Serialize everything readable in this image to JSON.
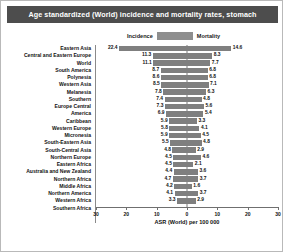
{
  "chart": {
    "title": "Age standardized (World) incidence and mortality rates, stomach",
    "xlabel": "ASR (World) per 100 000",
    "legend": {
      "left_label": "Incidence",
      "right_label": "Mortality",
      "swatch_color": "#8e8e8e"
    },
    "colors": {
      "bar": "#7f7f7f",
      "title_banner": "#4d4d4d",
      "title_text": "#ffffff",
      "axis": "#6f6f6f",
      "background": "#ffffff"
    },
    "xticks": [
      "30",
      "20",
      "10",
      "0",
      "10",
      "20",
      "30"
    ]
  },
  "chart_data": {
    "type": "bar",
    "title": "Age standardized (World) incidence and mortality rates, stomach",
    "xlabel": "ASR (World) per 100 000",
    "ylabel": "",
    "orientation": "horizontal-diverging",
    "xlim": [
      -30,
      30
    ],
    "grid": false,
    "legend_position": "top-center",
    "categories": [
      "Eastern Asia",
      "Central and Eastern Europe",
      "World",
      "South America",
      "Polynesia",
      "Western Asia",
      "Melanesia",
      "Southern",
      "Europe Central",
      "America",
      "Caribbean",
      "Western Europe",
      "Micronesia",
      "South-Eastern Asia",
      "South-Central Asia",
      "Northern Europe",
      "Eastern Africa",
      "Australia and New Zealand",
      "Northern Africa",
      "Middle Africa",
      "Northern America",
      "Western Africa",
      "Southern Africa"
    ],
    "series": [
      {
        "name": "Incidence",
        "values": [
          22.4,
          11.3,
          11.1,
          8.7,
          8.6,
          8.5,
          7.8,
          7.4,
          7.3,
          6.9,
          5.9,
          5.8,
          5.9,
          5.5,
          4.8,
          4.5,
          4.5,
          4.4,
          4.7,
          4.2,
          4.1,
          3.3,
          null
        ]
      },
      {
        "name": "Mortality",
        "values": [
          14.6,
          8.3,
          7.7,
          6.8,
          6.8,
          7.1,
          6.3,
          4.8,
          5.6,
          5.4,
          3.3,
          4.1,
          4.5,
          4.8,
          2.9,
          4.6,
          2.1,
          3.6,
          3.7,
          1.6,
          3.7,
          2.9,
          null
        ]
      }
    ],
    "rows": [
      {
        "category": "Eastern Asia",
        "incidence": 22.4,
        "mortality": 14.6
      },
      {
        "category": "Central and Eastern Europe",
        "incidence": 11.3,
        "mortality": 8.3
      },
      {
        "category": "World",
        "incidence": 11.1,
        "mortality": 7.7
      },
      {
        "category": "South America",
        "incidence": 8.7,
        "mortality": 6.8
      },
      {
        "category": "Polynesia",
        "incidence": 8.6,
        "mortality": 6.8
      },
      {
        "category": "Western Asia",
        "incidence": 8.5,
        "mortality": 7.1
      },
      {
        "category": "Melanesia",
        "incidence": 7.8,
        "mortality": 6.3
      },
      {
        "category": "Southern",
        "incidence": 7.4,
        "mortality": 4.8
      },
      {
        "category": "Europe Central",
        "incidence": 7.3,
        "mortality": 5.6
      },
      {
        "category": "America",
        "incidence": 6.9,
        "mortality": 5.4
      },
      {
        "category": "Caribbean",
        "incidence": 5.9,
        "mortality": 3.3
      },
      {
        "category": "Western Europe",
        "incidence": 5.8,
        "mortality": 4.1
      },
      {
        "category": "Micronesia",
        "incidence": 5.9,
        "mortality": 4.5
      },
      {
        "category": "South-Eastern Asia",
        "incidence": 5.5,
        "mortality": 4.8
      },
      {
        "category": "South-Central Asia",
        "incidence": 4.8,
        "mortality": 2.9
      },
      {
        "category": "Northern Europe",
        "incidence": 4.5,
        "mortality": 4.6
      },
      {
        "category": "Eastern Africa",
        "incidence": 4.5,
        "mortality": 2.1
      },
      {
        "category": "Australia and New Zealand",
        "incidence": 4.4,
        "mortality": 3.6
      },
      {
        "category": "Northern Africa",
        "incidence": 4.7,
        "mortality": 3.7
      },
      {
        "category": "Middle Africa",
        "incidence": 4.2,
        "mortality": 1.6
      },
      {
        "category": "Northern America",
        "incidence": 4.1,
        "mortality": 3.7
      },
      {
        "category": "Western Africa",
        "incidence": 3.3,
        "mortality": 2.9
      },
      {
        "category": "Southern Africa",
        "incidence": null,
        "mortality": null
      }
    ]
  }
}
